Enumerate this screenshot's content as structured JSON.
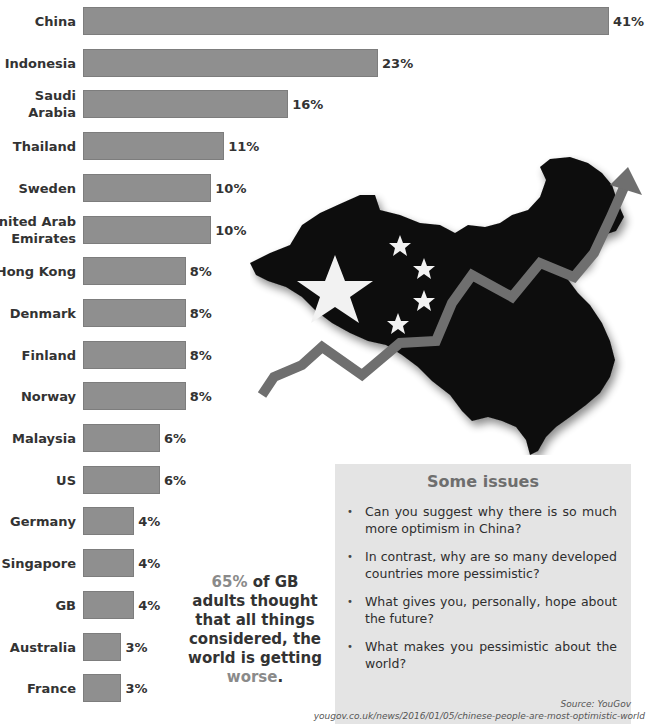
{
  "chart_data": {
    "type": "bar",
    "orientation": "horizontal",
    "title": "",
    "xlabel": "",
    "ylabel": "",
    "grid": false,
    "value_suffix": "%",
    "categories": [
      "China",
      "Indonesia",
      "Saudi Arabia",
      "Thailand",
      "Sweden",
      "United Arab Emirates",
      "Hong Kong",
      "Denmark",
      "Finland",
      "Norway",
      "Malaysia",
      "US",
      "Germany",
      "Singapore",
      "GB",
      "Australia",
      "France"
    ],
    "display_labels": [
      "China",
      "Indonesia",
      "Saudi Arabia",
      "Thailand",
      "Sweden",
      "United Arab\nEmirates",
      "Hong Kong",
      "Denmark",
      "Finland",
      "Norway",
      "Malaysia",
      "US",
      "Germany",
      "Singapore",
      "GB",
      "Australia",
      "France"
    ],
    "values": [
      41,
      23,
      16,
      11,
      10,
      10,
      8,
      8,
      8,
      8,
      6,
      6,
      4,
      4,
      4,
      3,
      3
    ],
    "value_labels": [
      "41%",
      "23%",
      "16%",
      "11%",
      "10%",
      "10%",
      "8%",
      "8%",
      "8%",
      "8%",
      "6%",
      "6%",
      "4%",
      "4%",
      "4%",
      "3%",
      "3%"
    ],
    "bar_color": "#8f8f8f"
  },
  "callout": {
    "highlight_pct": "65%",
    "line1_rest": " of GB",
    "line2": "adults thought",
    "line3": "that all things",
    "line4": "considered, the",
    "line5": "world is getting",
    "highlight_word": "worse",
    "end": "."
  },
  "issues": {
    "title": "Some issues",
    "items": [
      "Can you suggest why there is so much more optimism in China?",
      "In contrast, why are so many developed countries more pessimistic?",
      "What gives you, personally, hope about the future?",
      "What makes you pessimistic about the world?"
    ]
  },
  "source": {
    "label": "Source: YouGov",
    "url": "yougov.co.uk/news/2016/01/05/chinese-people-are-most-optimistic-world"
  },
  "colors": {
    "bar": "#8f8f8f",
    "highlight": "#8a8a8a",
    "issues_bg": "#e4e4e4",
    "issues_title": "#6e6e6e"
  }
}
